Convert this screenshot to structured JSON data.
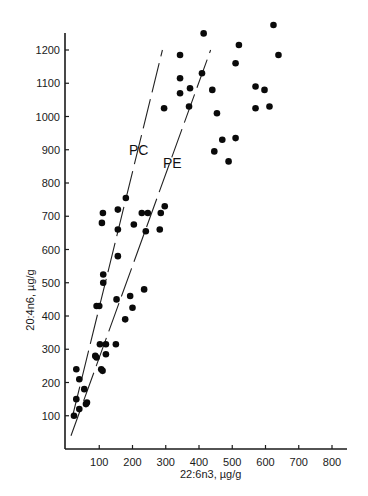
{
  "chart_data": {
    "type": "scatter",
    "title": "",
    "xlabel": "22:6n3, µg/g",
    "ylabel": "20:4n6, µg/g",
    "xlim": [
      0,
      850
    ],
    "ylim": [
      0,
      1250
    ],
    "x_ticks": [
      100,
      200,
      300,
      400,
      500,
      600,
      700,
      800
    ],
    "y_ticks": [
      100,
      200,
      300,
      400,
      500,
      600,
      700,
      800,
      900,
      1000,
      1100,
      1200
    ],
    "grid": false,
    "legend": null,
    "series": [
      {
        "name": "data points",
        "points": [
          [
            24,
            100
          ],
          [
            31,
            150
          ],
          [
            31,
            240
          ],
          [
            40,
            120
          ],
          [
            40,
            210
          ],
          [
            55,
            180
          ],
          [
            60,
            135
          ],
          [
            63,
            140
          ],
          [
            88,
            280
          ],
          [
            92,
            275
          ],
          [
            92,
            430
          ],
          [
            100,
            430
          ],
          [
            102,
            315
          ],
          [
            106,
            240
          ],
          [
            110,
            235
          ],
          [
            112,
            500
          ],
          [
            112,
            525
          ],
          [
            120,
            315
          ],
          [
            120,
            285
          ],
          [
            152,
            450
          ],
          [
            150,
            315
          ],
          [
            156,
            580
          ],
          [
            178,
            390
          ],
          [
            193,
            460
          ],
          [
            200,
            425
          ],
          [
            235,
            480
          ],
          [
            108,
            680
          ],
          [
            111,
            710
          ],
          [
            156,
            720
          ],
          [
            156,
            660
          ],
          [
            180,
            755
          ],
          [
            204,
            675
          ],
          [
            228,
            710
          ],
          [
            246,
            710
          ],
          [
            240,
            655
          ],
          [
            282,
            660
          ],
          [
            285,
            710
          ],
          [
            297,
            730
          ],
          [
            295,
            1025
          ],
          [
            343,
            1185
          ],
          [
            343,
            1115
          ],
          [
            343,
            1070
          ],
          [
            370,
            1030
          ],
          [
            373,
            1085
          ],
          [
            409,
            1130
          ],
          [
            414,
            1250
          ],
          [
            440,
            1080
          ],
          [
            454,
            1010
          ],
          [
            470,
            930
          ],
          [
            446,
            895
          ],
          [
            489,
            865
          ],
          [
            510,
            935
          ],
          [
            510,
            1160
          ],
          [
            520,
            1215
          ],
          [
            570,
            1090
          ],
          [
            570,
            1025
          ],
          [
            597,
            1080
          ],
          [
            612,
            1030
          ],
          [
            624,
            1275
          ],
          [
            639,
            1185
          ]
        ]
      }
    ],
    "fit_lines": [
      {
        "name": "PC",
        "from": [
          20,
          100
        ],
        "to": [
          290,
          1200
        ],
        "style": "dashed"
      },
      {
        "name": "PE",
        "from": [
          15,
          40
        ],
        "to": [
          435,
          1200
        ],
        "style": "dashed"
      }
    ],
    "annotations": [
      {
        "text": "PC",
        "x": 208,
        "y": 900
      },
      {
        "text": "PE",
        "x": 320,
        "y": 860
      }
    ]
  },
  "labels": {
    "x_axis_title": "22:6n3, µg/g",
    "y_axis_title": "20:4n6, µg/g",
    "pc_label": "PC",
    "pe_label": "PE"
  }
}
